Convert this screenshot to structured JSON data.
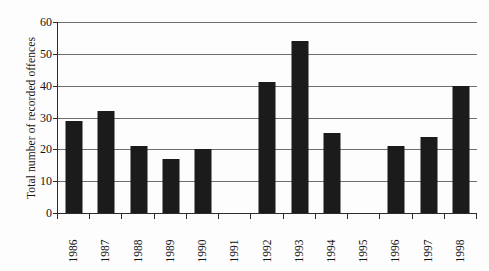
{
  "chart_data": {
    "type": "bar",
    "title": "",
    "subtitle": "",
    "xlabel": "",
    "ylabel": "Total number of recorded offences",
    "categories": [
      "1986",
      "1987",
      "1988",
      "1989",
      "1990",
      "1991",
      "1992",
      "1993",
      "1994",
      "1995",
      "1996",
      "1997",
      "1998"
    ],
    "values": [
      29,
      32,
      21,
      17,
      20,
      0,
      41,
      54,
      25,
      0,
      21,
      24,
      40
    ],
    "series": [
      {
        "name": "Total number of recorded offences",
        "values": [
          29,
          32,
          21,
          17,
          20,
          0,
          41,
          54,
          25,
          0,
          21,
          24,
          40
        ]
      }
    ],
    "ylim": [
      0,
      60
    ],
    "y_ticks": [
      0,
      10,
      20,
      30,
      40,
      50,
      60
    ],
    "y_tick_labels": [
      "0",
      "10",
      "20",
      "30",
      "40",
      "50",
      "60"
    ],
    "grid": true,
    "grid_axis": "y",
    "legend": false,
    "legend_position": "none",
    "bar_color": "#1b1b1b",
    "axis_color": "#2b2b2b",
    "gridline_color": "#6e6e6e",
    "background_color": "#fdfdfd"
  }
}
